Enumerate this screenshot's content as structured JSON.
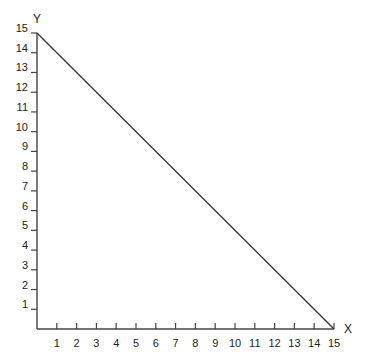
{
  "chart_data": {
    "type": "line",
    "title": "",
    "xlabel": "X",
    "ylabel": "Y",
    "xlim": [
      0,
      15
    ],
    "ylim": [
      0,
      15
    ],
    "grid": false,
    "legend": null,
    "x_ticks": [
      1,
      2,
      3,
      4,
      5,
      6,
      7,
      8,
      9,
      10,
      11,
      12,
      13,
      14,
      15
    ],
    "y_ticks": [
      1,
      2,
      3,
      4,
      5,
      6,
      7,
      8,
      9,
      10,
      11,
      12,
      13,
      14,
      15
    ],
    "series": [
      {
        "name": "line",
        "x": [
          0,
          15
        ],
        "y": [
          15,
          0
        ],
        "color": "#333333"
      }
    ]
  },
  "colors": {
    "axis": "#444444",
    "line": "#333333",
    "text": "#222222",
    "background": "#ffffff"
  }
}
